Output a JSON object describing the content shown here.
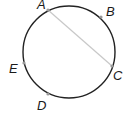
{
  "diagram": {
    "type": "circle-with-chord",
    "circle": {
      "cx": 69,
      "cy": 52,
      "r": 46,
      "stroke": "#222222"
    },
    "chord": {
      "from": "A",
      "to": "C",
      "stroke": "#c8c8c8"
    },
    "points": [
      {
        "name": "A",
        "x": 48,
        "y": 10,
        "label_x": 37,
        "label_y": 9
      },
      {
        "name": "B",
        "x": 101,
        "y": 17,
        "label_x": 106,
        "label_y": 16
      },
      {
        "name": "C",
        "x": 112,
        "y": 66,
        "label_x": 113,
        "label_y": 80
      },
      {
        "name": "E",
        "x": 24,
        "y": 63,
        "label_x": 9,
        "label_y": 73
      },
      {
        "name": "D",
        "x": 48,
        "y": 94,
        "label_x": 37,
        "label_y": 110
      }
    ],
    "point_color": "#9a9a9a"
  }
}
